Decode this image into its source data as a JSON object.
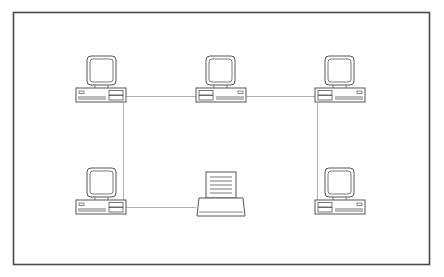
{
  "diagram": {
    "colors": {
      "frame": "#4a4a4a",
      "stroke": "#555555",
      "link": "#9a9a9a",
      "background": "#ffffff"
    },
    "nodes": [
      {
        "id": "pc-top-left",
        "type": "computer",
        "orientation": "drives-right"
      },
      {
        "id": "pc-top-middle",
        "type": "computer",
        "orientation": "drives-left"
      },
      {
        "id": "pc-top-right",
        "type": "computer",
        "orientation": "drives-left"
      },
      {
        "id": "pc-bottom-left",
        "type": "computer",
        "orientation": "drives-right"
      },
      {
        "id": "printer-bottom-middle",
        "type": "printer"
      },
      {
        "id": "pc-bottom-right",
        "type": "computer",
        "orientation": "drives-left"
      }
    ],
    "links": [
      {
        "from": "pc-top-left",
        "to": "pc-top-middle"
      },
      {
        "from": "pc-top-middle",
        "to": "pc-top-right"
      },
      {
        "from": "pc-top-left",
        "to": "pc-bottom-left"
      },
      {
        "from": "pc-bottom-left",
        "to": "printer-bottom-middle"
      },
      {
        "from": "pc-top-right",
        "to": "pc-bottom-right"
      }
    ]
  }
}
